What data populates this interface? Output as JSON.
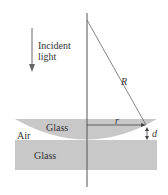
{
  "diagram": {
    "incident_label_line1": "Incident",
    "incident_label_line2": "light",
    "radius_label": "R",
    "r_label": "r",
    "d_label": "d",
    "lens_label": "Glass",
    "air_label": "Air",
    "plate_label": "Glass",
    "colors": {
      "glass": "#c8c8c8",
      "line": "#555555",
      "background": "#ffffff"
    }
  }
}
